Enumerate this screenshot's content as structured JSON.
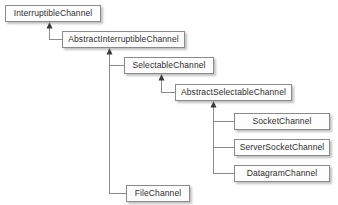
{
  "diagram": {
    "type": "uml-class-hierarchy",
    "background_color": "#ffffff",
    "node_fill_color": "#fdfdfd",
    "node_border_color": "#8a8a8a",
    "text_color": "#2e2e2e",
    "edge_color": "#8a8a8a",
    "edge_style": "orthogonal-elbow",
    "arrow_style": "solid-filled-triangle-pointing-to-supertype",
    "nodes": [
      {
        "id": "interruptible-channel",
        "label": "InterruptibleChannel",
        "x": 5,
        "y": 5,
        "w": 96,
        "h": 17,
        "kind": "interface"
      },
      {
        "id": "abstract-interruptible-channel",
        "label": "AbstractInterruptibleChannel",
        "x": 62,
        "y": 31,
        "w": 123,
        "h": 17,
        "kind": "abstract-class"
      },
      {
        "id": "selectable-channel",
        "label": "SelectableChannel",
        "x": 124,
        "y": 57,
        "w": 90,
        "h": 17,
        "kind": "abstract-class"
      },
      {
        "id": "abstract-selectable-channel",
        "label": "AbstractSelectableChannel",
        "x": 175,
        "y": 84,
        "w": 117,
        "h": 17,
        "kind": "abstract-class"
      },
      {
        "id": "socket-channel",
        "label": "SocketChannel",
        "x": 234,
        "y": 113,
        "w": 96,
        "h": 17,
        "kind": "abstract-class"
      },
      {
        "id": "server-socket-channel",
        "label": "ServerSocketChannel",
        "x": 234,
        "y": 139,
        "w": 96,
        "h": 17,
        "kind": "abstract-class"
      },
      {
        "id": "datagram-channel",
        "label": "DatagramChannel",
        "x": 234,
        "y": 165,
        "w": 96,
        "h": 17,
        "kind": "abstract-class"
      },
      {
        "id": "file-channel",
        "label": "FileChannel",
        "x": 126,
        "y": 185,
        "w": 64,
        "h": 17,
        "kind": "abstract-class"
      }
    ],
    "edges": [
      {
        "id": "edge-aic-to-ic",
        "from": "abstract-interruptible-channel",
        "to": "interruptible-channel",
        "relation": "generalization",
        "arrow_at": {
          "x": 49,
          "y": 22
        }
      },
      {
        "id": "edge-sc-to-aic",
        "from": "selectable-channel",
        "to": "abstract-interruptible-channel",
        "relation": "generalization",
        "arrow_at": {
          "x": 109,
          "y": 48
        }
      },
      {
        "id": "edge-fc-to-aic",
        "from": "file-channel",
        "to": "abstract-interruptible-channel",
        "relation": "generalization",
        "arrow_at": {
          "x": 109,
          "y": 48
        }
      },
      {
        "id": "edge-asc-to-sc",
        "from": "abstract-selectable-channel",
        "to": "selectable-channel",
        "relation": "generalization",
        "arrow_at": {
          "x": 161,
          "y": 74
        }
      },
      {
        "id": "edge-sock-to-asc",
        "from": "socket-channel",
        "to": "abstract-selectable-channel",
        "relation": "generalization",
        "arrow_at": {
          "x": 213,
          "y": 101
        }
      },
      {
        "id": "edge-ssock-to-asc",
        "from": "server-socket-channel",
        "to": "abstract-selectable-channel",
        "relation": "generalization",
        "arrow_at": {
          "x": 213,
          "y": 101
        }
      },
      {
        "id": "edge-dgram-to-asc",
        "from": "datagram-channel",
        "to": "abstract-selectable-channel",
        "relation": "generalization",
        "arrow_at": {
          "x": 213,
          "y": 101
        }
      }
    ]
  }
}
